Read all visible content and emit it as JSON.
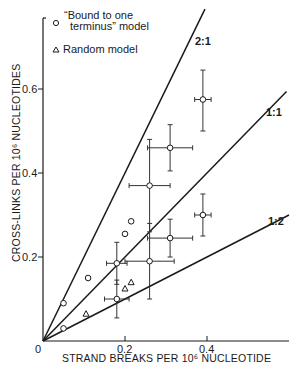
{
  "chart_data": {
    "type": "scatter",
    "title": "",
    "xlabel": "STRAND BREAKS PER 10⁶ NUCLEOTIDE",
    "ylabel": "CROSS-LINKS PER 10⁶ NUCLEOTIDES",
    "xlim": [
      0,
      0.6
    ],
    "ylim": [
      0,
      0.77
    ],
    "x_ticks": [
      {
        "value": 0,
        "label": "0"
      },
      {
        "value": 0.2,
        "label": "0.2"
      },
      {
        "value": 0.4,
        "label": "0.4"
      }
    ],
    "y_ticks": [
      {
        "value": 0.2,
        "label": "0.2"
      },
      {
        "value": 0.4,
        "label": "0.4"
      },
      {
        "value": 0.6,
        "label": "0.6"
      }
    ],
    "grid": false,
    "legend_position": "upper-left",
    "legend": [
      {
        "marker": "circle",
        "label_line1": "“Bound to one",
        "label_line2": "terminus” model"
      },
      {
        "marker": "triangle",
        "label_line1": "Random model"
      }
    ],
    "reference_lines": [
      {
        "label": "2:1",
        "slope": 2.0
      },
      {
        "label": "1:1",
        "slope": 1.0
      },
      {
        "label": "1:2",
        "slope": 0.5
      }
    ],
    "series": [
      {
        "name": "Bound to one terminus model",
        "marker": "circle",
        "points": [
          {
            "x": 0.05,
            "y": 0.09
          },
          {
            "x": 0.11,
            "y": 0.15
          },
          {
            "x": 0.2,
            "y": 0.255
          },
          {
            "x": 0.215,
            "y": 0.285
          },
          {
            "x": 0.05,
            "y": 0.03
          }
        ]
      },
      {
        "name": "Random model",
        "marker": "triangle",
        "points": [
          {
            "x": 0.105,
            "y": 0.065
          },
          {
            "x": 0.2,
            "y": 0.125
          },
          {
            "x": 0.215,
            "y": 0.14
          }
        ]
      },
      {
        "name": "Experimental (with error bars)",
        "marker": "circle",
        "points": [
          {
            "x": 0.39,
            "y": 0.575,
            "xerr": 0.02,
            "yerr_low": 0.075,
            "yerr_high": 0.07
          },
          {
            "x": 0.31,
            "y": 0.46,
            "xerr": 0.055,
            "yerr": 0.055
          },
          {
            "x": 0.26,
            "y": 0.37,
            "xerr": 0.05,
            "yerr": 0.11
          },
          {
            "x": 0.39,
            "y": 0.3,
            "xerr": 0.02,
            "yerr": 0.05
          },
          {
            "x": 0.31,
            "y": 0.245,
            "xerr": 0.055,
            "yerr": 0.045
          },
          {
            "x": 0.26,
            "y": 0.19,
            "xerr": 0.06,
            "yerr": 0.09
          },
          {
            "x": 0.18,
            "y": 0.185,
            "xerr": 0.025,
            "yerr": 0.05
          },
          {
            "x": 0.18,
            "y": 0.1,
            "xerr": 0.03,
            "yerr": 0.045
          }
        ]
      }
    ]
  }
}
